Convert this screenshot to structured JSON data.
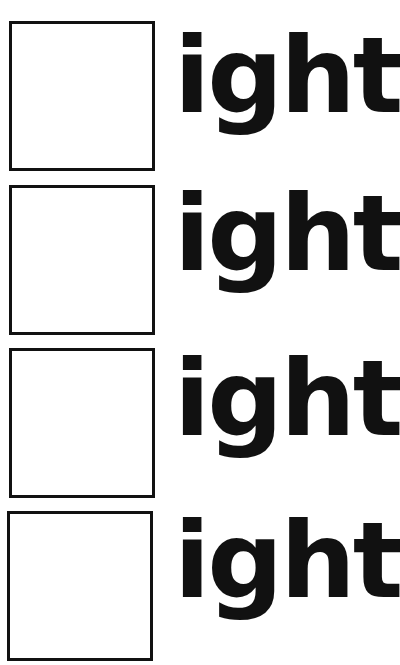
{
  "worksheet": {
    "rows": [
      {
        "blank": "",
        "ending": "ight"
      },
      {
        "blank": "",
        "ending": "ight"
      },
      {
        "blank": "",
        "ending": "ight"
      },
      {
        "blank": "",
        "ending": "ight"
      }
    ]
  },
  "colors": {
    "ink": "#111111",
    "paper": "#ffffff"
  }
}
